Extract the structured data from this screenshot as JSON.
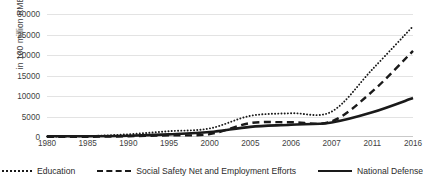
{
  "chart_data": {
    "type": "line",
    "title": "",
    "subtitle": "",
    "xlabel": "",
    "ylabel": "in 100 million RMB",
    "categories": [
      "1980",
      "1985",
      "1990",
      "1995",
      "2000",
      "2005",
      "2006",
      "2007",
      "2011",
      "2016"
    ],
    "ylim": [
      0,
      30000
    ],
    "ytick_values": [
      0,
      5000,
      10000,
      15000,
      20000,
      25000,
      30000
    ],
    "ytick_labels": [
      "0",
      "5000",
      "10000",
      "15000",
      "20000",
      "25000",
      "30000"
    ],
    "grid": true,
    "grid_axis": "y",
    "legend_position": "bottom",
    "series": [
      {
        "name": "Education",
        "style": "dotted",
        "color": "#1a1a1a",
        "values": [
          113,
          224,
          659,
          1412,
          2085,
          5161,
          5800,
          6200,
          16497,
          27000
        ]
      },
      {
        "name": "Social Safety Net and Employment Efforts",
        "style": "dashed",
        "color": "#1a1a1a",
        "values": [
          30,
          60,
          180,
          400,
          700,
          3400,
          3600,
          3800,
          11109,
          21000
        ]
      },
      {
        "name": "National Defense",
        "style": "solid",
        "color": "#1a1a1a",
        "values": [
          194,
          191,
          290,
          637,
          1207,
          2475,
          2980,
          3554,
          6028,
          9500
        ]
      }
    ]
  },
  "axis": {
    "y_title": "in 100 million RMB"
  }
}
